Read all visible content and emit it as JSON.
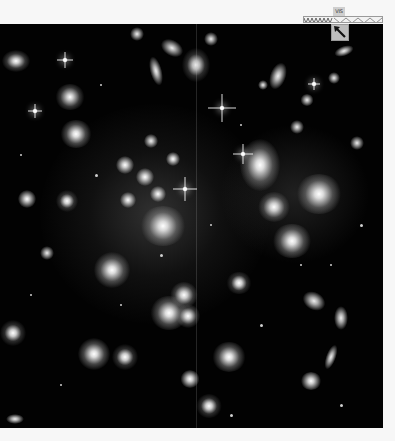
{
  "image": {
    "subject": "galaxy cluster deep field",
    "background_color": "#020202",
    "page_background": "#f7f7f7"
  },
  "overlay": {
    "filter_label": "VIS",
    "scale_bar_icon": "zigzag-ruler-icon",
    "compass_icon": "compass-arrow-icon"
  },
  "stars": [
    {
      "x": 65,
      "y": 36,
      "size": 16
    },
    {
      "x": 222,
      "y": 84,
      "size": 26
    },
    {
      "x": 35,
      "y": 87,
      "size": 14
    },
    {
      "x": 185,
      "y": 165,
      "size": 22
    },
    {
      "x": 243,
      "y": 130,
      "size": 18
    },
    {
      "x": 270,
      "y": 30,
      "size": 12
    }
  ]
}
